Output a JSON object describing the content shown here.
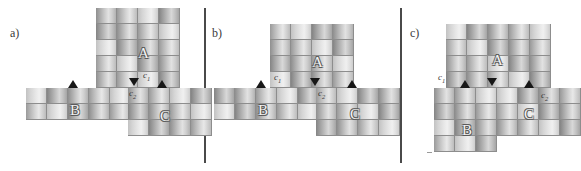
{
  "figure": {
    "width": 576,
    "height": 171,
    "background": "#ffffff",
    "divider_color": "#4a4a4a",
    "marker_color": "#171717",
    "cell_border_color": "#8d8d8d",
    "letter_color": "#f2f2f2",
    "label_color": "#3a3a3a"
  },
  "panels": [
    {
      "id": "panel-a",
      "label": "a)",
      "label_x": 10,
      "label_y": 26,
      "blocks": [
        {
          "name": "A",
          "letter": "A",
          "cols": 4,
          "rows": 5,
          "x": 96,
          "y": 8,
          "cell_w": 21,
          "cell_h": 16,
          "letter_x": 138,
          "letter_y": 45
        },
        {
          "name": "B",
          "letter": "B",
          "cols": 5,
          "rows": 2,
          "x": 26,
          "y": 88,
          "cell_w": 21,
          "cell_h": 16,
          "letter_x": 70,
          "letter_y": 102
        },
        {
          "name": "C",
          "letter": "C",
          "cols": 4,
          "rows": 3,
          "x": 128,
          "y": 88,
          "cell_w": 21,
          "cell_h": 16,
          "letter_x": 160,
          "letter_y": 108
        }
      ],
      "contacts": [
        {
          "name": "c1",
          "text": "c",
          "sub": "1",
          "x": 143,
          "y": 70
        },
        {
          "name": "c2",
          "text": "c",
          "sub": "2",
          "x": 129,
          "y": 88
        }
      ],
      "markers": [
        {
          "name": "marker-down-c2",
          "dir": "down",
          "x": 129,
          "y": 78
        },
        {
          "name": "marker-up-c",
          "dir": "up",
          "x": 157,
          "y": 80
        },
        {
          "name": "marker-up-b",
          "dir": "up",
          "x": 68,
          "y": 80
        }
      ]
    },
    {
      "id": "panel-b",
      "label": "b)",
      "label_x": 212,
      "label_y": 26,
      "blocks": [
        {
          "name": "A",
          "letter": "A",
          "cols": 4,
          "rows": 4,
          "x": 270,
          "y": 24,
          "cell_w": 21,
          "cell_h": 16,
          "letter_x": 312,
          "letter_y": 54
        },
        {
          "name": "B",
          "letter": "B",
          "cols": 5,
          "rows": 2,
          "x": 214,
          "y": 88,
          "cell_w": 21,
          "cell_h": 16,
          "letter_x": 258,
          "letter_y": 102
        },
        {
          "name": "C",
          "letter": "C",
          "cols": 4,
          "rows": 3,
          "x": 316,
          "y": 88,
          "cell_w": 21,
          "cell_h": 16,
          "letter_x": 350,
          "letter_y": 106
        }
      ],
      "contacts": [
        {
          "name": "c1",
          "text": "c",
          "sub": "1",
          "x": 274,
          "y": 72
        },
        {
          "name": "c2",
          "text": "c",
          "sub": "2",
          "x": 318,
          "y": 88
        }
      ],
      "markers": [
        {
          "name": "marker-down-c1",
          "dir": "down",
          "x": 310,
          "y": 78
        },
        {
          "name": "marker-up-c",
          "dir": "up",
          "x": 347,
          "y": 80
        },
        {
          "name": "marker-up-b",
          "dir": "up",
          "x": 256,
          "y": 80
        }
      ]
    },
    {
      "id": "panel-c",
      "label": "c)",
      "label_x": 410,
      "label_y": 26,
      "blocks": [
        {
          "name": "A",
          "letter": "A",
          "cols": 5,
          "rows": 4,
          "x": 446,
          "y": 24,
          "cell_w": 21,
          "cell_h": 16,
          "letter_x": 492,
          "letter_y": 52
        },
        {
          "name": "B",
          "letter": "B",
          "cols": 3,
          "rows": 4,
          "x": 434,
          "y": 88,
          "cell_w": 21,
          "cell_h": 16,
          "letter_x": 462,
          "letter_y": 122
        },
        {
          "name": "C",
          "letter": "C",
          "cols": 4,
          "rows": 3,
          "x": 497,
          "y": 88,
          "cell_w": 21,
          "cell_h": 16,
          "letter_x": 524,
          "letter_y": 106
        }
      ],
      "contacts": [
        {
          "name": "c1",
          "text": "c",
          "sub": "1",
          "x": 438,
          "y": 72
        },
        {
          "name": "c2",
          "text": "c",
          "sub": "2",
          "x": 541,
          "y": 90
        }
      ],
      "markers": [
        {
          "name": "marker-down-a",
          "dir": "down",
          "x": 487,
          "y": 78
        },
        {
          "name": "marker-up-b",
          "dir": "up",
          "x": 460,
          "y": 80
        },
        {
          "name": "marker-up-c",
          "dir": "up",
          "x": 524,
          "y": 80
        }
      ]
    }
  ],
  "dividers": [
    {
      "name": "divider-a-b",
      "x": 204
    },
    {
      "name": "divider-b-c",
      "x": 400
    }
  ]
}
